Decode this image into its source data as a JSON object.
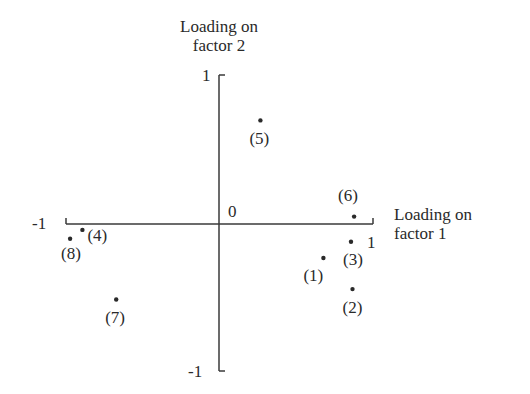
{
  "chart_data": {
    "type": "scatter",
    "title": "",
    "xlabel": "Loading on factor 1",
    "ylabel": "Loading on factor 2",
    "xlabel_lines": [
      "Loading on",
      "factor 1"
    ],
    "ylabel_lines": [
      "Loading on",
      "factor 2"
    ],
    "xlim": [
      -1,
      1
    ],
    "ylim": [
      -1,
      1
    ],
    "x_ticks": [
      "-1",
      "1"
    ],
    "y_ticks": [
      "1",
      "-1"
    ],
    "origin_label": "0",
    "grid": false,
    "legend": null,
    "points": [
      {
        "label": "(1)",
        "x": 0.68,
        "y": -0.23
      },
      {
        "label": "(2)",
        "x": 0.87,
        "y": -0.44
      },
      {
        "label": "(3)",
        "x": 0.86,
        "y": -0.12
      },
      {
        "label": "(4)",
        "x": -0.89,
        "y": -0.04
      },
      {
        "label": "(5)",
        "x": 0.27,
        "y": 0.7
      },
      {
        "label": "(6)",
        "x": 0.88,
        "y": 0.05
      },
      {
        "label": "(7)",
        "x": -0.67,
        "y": -0.51
      },
      {
        "label": "(8)",
        "x": -0.97,
        "y": -0.1
      }
    ]
  },
  "colors": {
    "ink": "#2a2a2a",
    "background": "#ffffff"
  }
}
